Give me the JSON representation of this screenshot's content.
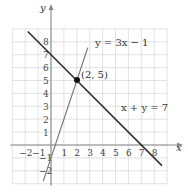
{
  "chart_data": {
    "type": "line",
    "title": "",
    "xlabel": "x",
    "ylabel": "y",
    "xlim": [
      -3,
      9
    ],
    "ylim": [
      -3,
      9
    ],
    "grid": true,
    "x_ticks": [
      -2,
      -1,
      1,
      2,
      3,
      4,
      5,
      6,
      7,
      8
    ],
    "y_ticks": [
      -2,
      -1,
      1,
      2,
      3,
      4,
      5,
      6,
      7,
      8
    ],
    "series": [
      {
        "name": "y = 3x − 1",
        "equation": "y = 3x - 1",
        "slope": 3,
        "intercept": -1,
        "x": [
          -0.6,
          2.85
        ],
        "y": [
          -2.8,
          7.55
        ],
        "color": "#777777"
      },
      {
        "name": "x + y = 7",
        "equation": "x + y = 7",
        "slope": -1,
        "intercept": 7,
        "x": [
          -1.8,
          8.6
        ],
        "y": [
          8.8,
          -1.6
        ],
        "color": "#333333"
      }
    ],
    "annotations": [
      {
        "type": "point",
        "x": 2,
        "y": 5,
        "label": "(2, 5)"
      }
    ]
  },
  "labels": {
    "x_axis": "x",
    "y_axis": "y",
    "eq1": "y = 3x − 1",
    "eq2": "x + y = 7",
    "point": "(2, 5)"
  }
}
